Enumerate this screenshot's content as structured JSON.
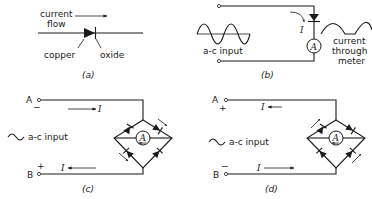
{
  "panels": {
    "a": {
      "caption": "(a)",
      "flow_label_line1": "current",
      "flow_label_line2": "flow",
      "copper_label": "copper",
      "oxide_label": "oxide"
    },
    "b": {
      "caption": "(b)",
      "input_label": "a-c input",
      "current_symbol": "I",
      "meter_symbol": "A",
      "output_label_line1": "current",
      "output_label_line2": "through",
      "output_label_line3": "meter"
    },
    "c": {
      "caption": "(c)",
      "terminal_a": "A",
      "terminal_a_polarity": "−",
      "terminal_b": "B",
      "terminal_b_polarity": "+",
      "input_label": "a-c input",
      "current_symbol_top": "I",
      "current_symbol_bottom": "I",
      "meter_symbol": "A"
    },
    "d": {
      "caption": "(d)",
      "terminal_a": "A",
      "terminal_a_polarity": "+",
      "terminal_b": "B",
      "terminal_b_polarity": "−",
      "input_label": "a-c input",
      "current_symbol_top": "I",
      "current_symbol_bottom": "I",
      "meter_symbol": "A"
    }
  },
  "colors": {
    "ink": "#1a1a1a",
    "background": "#ffffff"
  }
}
